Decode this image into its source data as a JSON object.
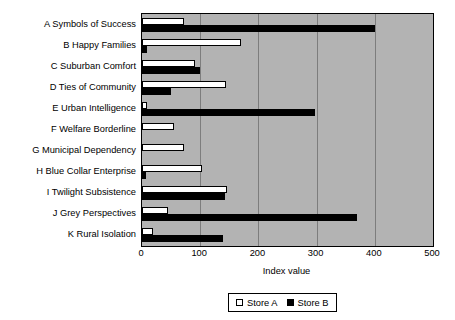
{
  "chart_data": {
    "type": "bar",
    "orientation": "horizontal",
    "title": "",
    "xlabel": "Index value",
    "ylabel": "",
    "xlim": [
      0,
      500
    ],
    "xticks": [
      0,
      100,
      200,
      300,
      400,
      500
    ],
    "xtick_labels": [
      "0",
      "100",
      "200",
      "300",
      "400",
      "500"
    ],
    "grid": true,
    "grid_axis": "x",
    "legend_position": "bottom",
    "plot_background": "#b3b3b3",
    "categories": [
      "A Symbols of Success",
      "B Happy Families",
      "C Suburban Comfort",
      "D Ties of Community",
      "E Urban Intelligence",
      "F Welfare Borderline",
      "G Municipal Dependency",
      "H Blue Collar Enterprise",
      "I Twilight Subsistence",
      "J Grey Perspectives",
      "K Rural Isolation"
    ],
    "series": [
      {
        "name": "Store A",
        "color": "#ffffff",
        "values": [
          72,
          170,
          91,
          144,
          9,
          55,
          72,
          103,
          146,
          45,
          19
        ]
      },
      {
        "name": "Store B",
        "color": "#000000",
        "values": [
          400,
          9,
          100,
          50,
          297,
          0,
          0,
          7,
          143,
          370,
          139
        ]
      }
    ]
  }
}
